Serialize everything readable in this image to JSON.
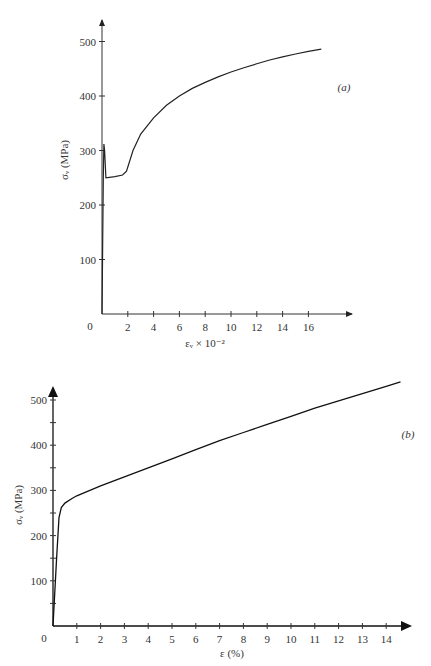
{
  "chart_data": [
    {
      "id": "a",
      "type": "line",
      "panel_label": "(a)",
      "title": "",
      "xlabel": "εᵥ × 10⁻²",
      "ylabel": "σᵥ (MPa)",
      "x_ticks": [
        "2",
        "4",
        "6",
        "8",
        "10",
        "12",
        "14",
        "16"
      ],
      "y_ticks": [
        "100",
        "200",
        "300",
        "400",
        "500"
      ],
      "origin_label": "0",
      "xlim": [
        0,
        18
      ],
      "ylim": [
        0,
        540
      ],
      "grid": false,
      "series": [
        {
          "name": "stress-strain (a)",
          "x": [
            0,
            0.1,
            0.15,
            0.2,
            0.3,
            1.0,
            1.6,
            1.9,
            2.4,
            3,
            4,
            5,
            6,
            7,
            8,
            9,
            10,
            11,
            12,
            13,
            14,
            15,
            16,
            17
          ],
          "y": [
            0,
            250,
            312,
            300,
            250,
            252,
            255,
            262,
            300,
            330,
            360,
            383,
            400,
            414,
            425,
            435,
            444,
            452,
            459,
            466,
            472,
            477,
            482,
            486
          ]
        }
      ]
    },
    {
      "id": "b",
      "type": "line",
      "panel_label": "(b)",
      "title": "",
      "xlabel": "ε (%)",
      "ylabel": "σᵥ (MPa)",
      "x_ticks": [
        "1",
        "2",
        "3",
        "4",
        "5",
        "6",
        "7",
        "8",
        "9",
        "10",
        "11",
        "12",
        "13",
        "14"
      ],
      "y_ticks": [
        "100",
        "200",
        "300",
        "400",
        "500"
      ],
      "origin_label": "0",
      "xlim": [
        0,
        15
      ],
      "ylim": [
        0,
        540
      ],
      "grid": false,
      "series": [
        {
          "name": "stress-strain (b)",
          "x": [
            0,
            0.15,
            0.25,
            0.35,
            0.5,
            0.8,
            1,
            2,
            3,
            4,
            5,
            6,
            7,
            8,
            9,
            10,
            11,
            12,
            13,
            14,
            14.6
          ],
          "y": [
            0,
            150,
            240,
            262,
            272,
            282,
            288,
            310,
            330,
            350,
            370,
            390,
            410,
            428,
            446,
            464,
            482,
            498,
            514,
            530,
            540
          ]
        }
      ]
    }
  ]
}
